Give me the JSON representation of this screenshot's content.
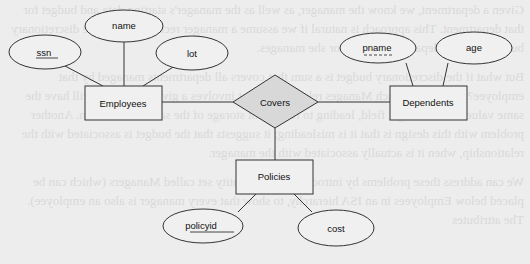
{
  "diagram": {
    "entities": [
      {
        "id": "employees",
        "label": "Employees"
      },
      {
        "id": "dependents",
        "label": "Dependents",
        "weak": true
      },
      {
        "id": "policies",
        "label": "Policies"
      }
    ],
    "relationships": [
      {
        "id": "covers",
        "label": "Covers",
        "connects": [
          "Employees",
          "Dependents",
          "Policies"
        ]
      }
    ],
    "attributes": {
      "employees": [
        {
          "label": "ssn",
          "key": true
        },
        {
          "label": "name",
          "key": false
        },
        {
          "label": "lot",
          "key": false
        }
      ],
      "dependents": [
        {
          "label": "pname",
          "partial_key": true
        },
        {
          "label": "age",
          "key": false
        }
      ],
      "policies": [
        {
          "label": "policyid",
          "key": true
        },
        {
          "label": "cost",
          "key": false
        }
      ]
    }
  }
}
